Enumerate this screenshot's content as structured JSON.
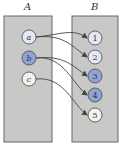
{
  "set_a": {
    "label": "A",
    "elements": [
      {
        "id": "a",
        "label": "a",
        "fill": "#e4e8f4",
        "cx": 29,
        "cy": 37
      },
      {
        "id": "b",
        "label": "b",
        "fill": "#8fa3d6",
        "cx": 29,
        "cy": 58
      },
      {
        "id": "c",
        "label": "c",
        "fill": "#f2f2ee",
        "cx": 29,
        "cy": 79
      }
    ]
  },
  "set_b": {
    "label": "B",
    "elements": [
      {
        "id": "1",
        "label": "1",
        "fill": "#e4e8f4",
        "cx": 95,
        "cy": 38
      },
      {
        "id": "2",
        "label": "2",
        "fill": "#e4e8f4",
        "cx": 95,
        "cy": 57
      },
      {
        "id": "3",
        "label": "3",
        "fill": "#8fa3d6",
        "cx": 95,
        "cy": 76
      },
      {
        "id": "4",
        "label": "4",
        "fill": "#8fa3d6",
        "cx": 95,
        "cy": 95
      },
      {
        "id": "5",
        "label": "5",
        "fill": "#f2f2ee",
        "cx": 95,
        "cy": 115
      }
    ]
  },
  "mappings": [
    {
      "from": "a",
      "to": "1"
    },
    {
      "from": "a",
      "to": "2"
    },
    {
      "from": "b",
      "to": "3"
    },
    {
      "from": "b",
      "to": "4"
    },
    {
      "from": "c",
      "to": "5"
    }
  ],
  "colors": {
    "set_fill": "#c8c8c6",
    "set_stroke": "#666666",
    "arrow": "#444444"
  }
}
